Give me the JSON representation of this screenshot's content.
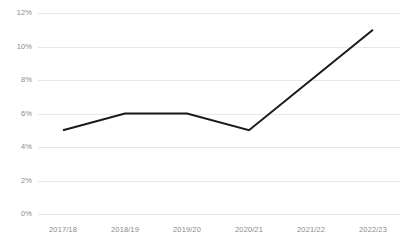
{
  "chart_data": {
    "type": "line",
    "title": "",
    "subtitle": "",
    "xlabel": "",
    "ylabel": "",
    "categories": [
      "2017/18",
      "2018/19",
      "2019/20",
      "2020/21",
      "2021/22",
      "2022/23"
    ],
    "series": [
      {
        "name": "",
        "values": [
          5,
          6,
          6,
          5,
          8,
          11
        ],
        "color": "#1a1a1a"
      }
    ],
    "ylim": [
      0,
      12
    ],
    "ytick_values": [
      0,
      2,
      4,
      6,
      8,
      10,
      12
    ],
    "ytick_labels": [
      "0%",
      "2%",
      "4%",
      "6%",
      "8%",
      "10%",
      "12%"
    ],
    "grid": true,
    "grid_axis": "y",
    "grid_color": "#e8e8e8",
    "legend": false,
    "legend_position": "none",
    "axis_label_color": "#8a8a8a",
    "background_color": "#ffffff"
  }
}
